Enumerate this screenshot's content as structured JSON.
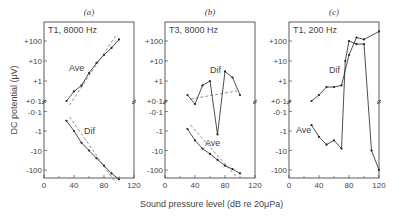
{
  "figure": {
    "xlabel": "Sound pressure level (dB re 20μPa)",
    "ylabel": "DC potential (μV)",
    "y_ticks": [
      "+100",
      "+10",
      "+1",
      "+0·1",
      "-0·1",
      "-1",
      "-10",
      "-100"
    ],
    "x_ticks": [
      "0",
      "40",
      "80",
      "120"
    ]
  },
  "chart_data": [
    {
      "type": "line",
      "panel": "(a)",
      "title": "T1, 8000 Hz",
      "xlabel": "Sound pressure level (dB re 20μPa)",
      "ylabel": "DC potential (μV)",
      "xlim": [
        0,
        120
      ],
      "yscale": "signed-log",
      "series": [
        {
          "name": "Ave",
          "x": [
            30,
            40,
            50,
            60,
            70,
            80,
            90,
            100
          ],
          "y": [
            0.1,
            0.3,
            0.6,
            2.5,
            8,
            20,
            45,
            120
          ]
        },
        {
          "name": "Dif",
          "x": [
            30,
            40,
            50,
            60,
            70,
            80,
            90,
            100
          ],
          "y": [
            -0.3,
            -1,
            -4,
            -10,
            -25,
            -60,
            -150,
            -300
          ]
        }
      ]
    },
    {
      "type": "line",
      "panel": "(b)",
      "title": "T3, 8000 Hz",
      "xlabel": "Sound pressure level (dB re 20μPa)",
      "ylabel": "DC potential (μV)",
      "xlim": [
        0,
        120
      ],
      "yscale": "signed-log",
      "series": [
        {
          "name": "Dif",
          "x": [
            30,
            40,
            50,
            60,
            70,
            80,
            90,
            100
          ],
          "y": [
            0.2,
            0.07,
            0.6,
            1,
            -1.5,
            3,
            1.5,
            0.2
          ]
        },
        {
          "name": "Ave",
          "x": [
            30,
            40,
            50,
            60,
            70,
            80,
            90,
            100
          ],
          "y": [
            -0.8,
            -3,
            -8,
            -15,
            -30,
            -60,
            -90,
            -150
          ]
        }
      ]
    },
    {
      "type": "line",
      "panel": "(c)",
      "title": "T1, 200 Hz",
      "xlabel": "Sound pressure level (dB re 20μPa)",
      "ylabel": "DC potential (μV)",
      "xlim": [
        0,
        120
      ],
      "yscale": "signed-log",
      "series": [
        {
          "name": "Dif",
          "x": [
            30,
            40,
            50,
            60,
            70,
            80,
            90,
            100,
            120
          ],
          "y": [
            0.1,
            0.2,
            0.5,
            0.5,
            0.6,
            20,
            150,
            120,
            300
          ]
        },
        {
          "name": "Ave",
          "x": [
            30,
            40,
            50,
            60,
            70,
            75,
            80,
            90,
            100,
            110,
            120
          ],
          "y": [
            -0.5,
            -2,
            -5,
            -3,
            -8,
            10,
            100,
            70,
            70,
            -10,
            -100
          ]
        }
      ]
    }
  ]
}
